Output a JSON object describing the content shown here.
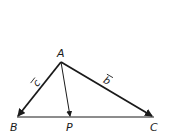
{
  "diagram": {
    "type": "vector-triangle",
    "points": {
      "A": {
        "label": "A",
        "x": 61,
        "y": 62
      },
      "B": {
        "label": "B",
        "x": 17,
        "y": 117
      },
      "P": {
        "label": "P",
        "x": 70,
        "y": 117
      },
      "C": {
        "label": "C",
        "x": 153,
        "y": 117
      }
    },
    "vectors": [
      {
        "from": "A",
        "to": "B",
        "label": "c",
        "arrow": "over-arrow"
      },
      {
        "from": "A",
        "to": "C",
        "label": "b",
        "arrow": "over-arrow"
      },
      {
        "from": "A",
        "to": "P",
        "label": ""
      }
    ],
    "segments": [
      {
        "from": "B",
        "to": "C"
      }
    ],
    "colors": {
      "stroke": "#1a1a1a",
      "background": "#ffffff"
    }
  }
}
